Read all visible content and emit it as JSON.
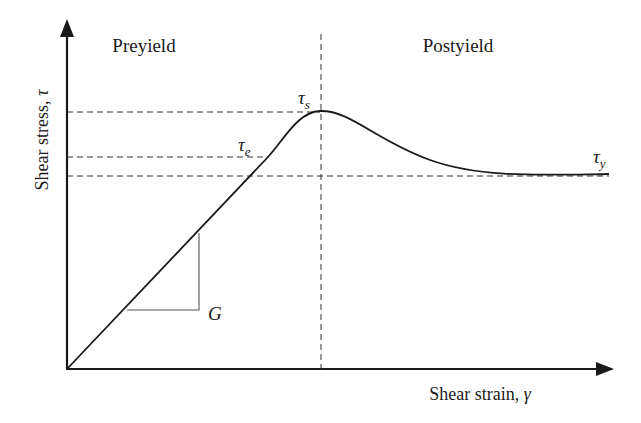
{
  "diagram": {
    "regions": {
      "left": "Preyield",
      "right": "Postyield"
    },
    "x_axis": {
      "label": "Shear strain, ",
      "symbol": "γ"
    },
    "y_axis": {
      "label": "Shear stress, ",
      "symbol": "τ"
    },
    "levels": {
      "static": {
        "symbol": "τ",
        "subscript": "s"
      },
      "elastic": {
        "symbol": "τ",
        "subscript": "e"
      },
      "dynamic": {
        "symbol": "τ",
        "subscript": "y"
      }
    },
    "slope": {
      "label": "G"
    },
    "colors": {
      "line": "#1a1a1a",
      "dashed": "#333333",
      "background": "#ffffff"
    }
  }
}
